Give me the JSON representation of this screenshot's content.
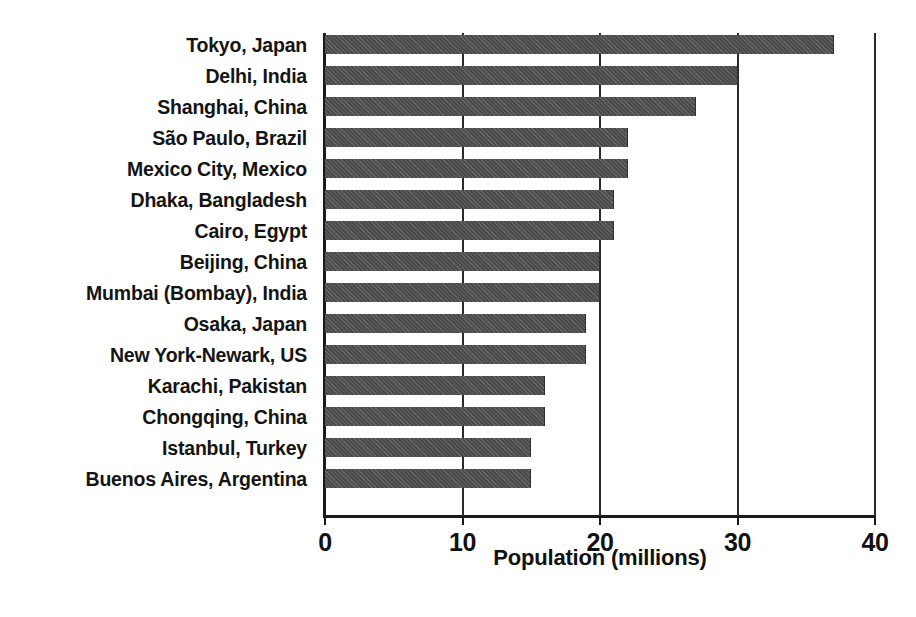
{
  "chart_data": {
    "type": "bar",
    "orientation": "horizontal",
    "title": "",
    "xlabel": "Population (millions)",
    "ylabel": "",
    "xlim": [
      0,
      40
    ],
    "xticks": [
      0,
      10,
      20,
      30,
      40
    ],
    "xtick_labels": [
      "0",
      "10",
      "20",
      "30",
      "40"
    ],
    "grid": true,
    "grid_axis": "x",
    "legend": false,
    "bar_color": "#4b4b4b",
    "categories": [
      "Tokyo, Japan",
      "Delhi, India",
      "Shanghai, China",
      "São Paulo, Brazil",
      "Mexico City, Mexico",
      "Dhaka, Bangladesh",
      "Cairo, Egypt",
      "Beijing, China",
      "Mumbai (Bombay), India",
      "Osaka, Japan",
      "New York-Newark, US",
      "Karachi, Pakistan",
      "Chongqing, China",
      "Istanbul, Turkey",
      "Buenos Aires, Argentina"
    ],
    "values": [
      37.0,
      30.0,
      27.0,
      22.0,
      22.0,
      21.0,
      21.0,
      20.0,
      20.0,
      19.0,
      19.0,
      16.0,
      16.0,
      15.0,
      15.0
    ]
  }
}
